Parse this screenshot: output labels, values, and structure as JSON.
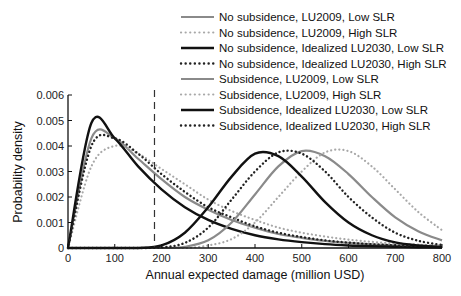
{
  "chart_data": {
    "type": "line",
    "title": "",
    "xlabel": "Annual expected damage (million USD)",
    "ylabel": "Probability density",
    "xlim": [
      0,
      800
    ],
    "ylim": [
      0,
      0.006
    ],
    "xticks": [
      0,
      100,
      200,
      300,
      400,
      500,
      600,
      700,
      800
    ],
    "xtick_labels": [
      "0",
      "100",
      "200",
      "300",
      "400",
      "500",
      "600",
      "700",
      "800"
    ],
    "yticks": [
      0,
      0.001,
      0.002,
      0.003,
      0.004,
      0.005,
      0.006
    ],
    "ytick_labels": [
      "0",
      "0.001",
      "0.002",
      "0.003",
      "0.004",
      "0.005",
      "0.006"
    ],
    "grid": false,
    "legend_position": "top-right",
    "annotations": [
      {
        "type": "vertical-dashed-line",
        "x": 185
      }
    ],
    "x": [
      0,
      50,
      100,
      150,
      200,
      250,
      300,
      350,
      400,
      450,
      500,
      550,
      600,
      650,
      700,
      750,
      800
    ],
    "series": [
      {
        "name": "No subsidence, LU2009, Low SLR",
        "style": "solid",
        "color": "#8a8a8a",
        "width": 2.2,
        "values": [
          0,
          0.0043,
          0.0043,
          0.0035,
          0.0027,
          0.002,
          0.0015,
          0.0011,
          0.0008,
          0.00055,
          0.0004,
          0.00028,
          0.0002,
          0.00014,
          0.0001,
          7e-05,
          5e-05
        ]
      },
      {
        "name": "No subsidence, LU2009, High SLR",
        "style": "dotted",
        "color": "#a8a8a8",
        "width": 2.2,
        "values": [
          0,
          0.0032,
          0.004,
          0.0037,
          0.0031,
          0.0025,
          0.0019,
          0.00145,
          0.0011,
          0.0008,
          0.0006,
          0.00045,
          0.00033,
          0.00024,
          0.00018,
          0.00013,
          0.0001
        ]
      },
      {
        "name": "No subsidence, Idealized LU2030, Low SLR",
        "style": "solid",
        "color": "#111111",
        "width": 2.4,
        "values": [
          0,
          0.0049,
          0.0043,
          0.0032,
          0.0023,
          0.0016,
          0.0011,
          0.00075,
          0.0005,
          0.00034,
          0.00023,
          0.00015,
          0.0001,
          7e-05,
          5e-05,
          3e-05,
          2e-05
        ]
      },
      {
        "name": "No subsidence, Idealized LU2030, High SLR",
        "style": "dotted",
        "color": "#222222",
        "width": 2.4,
        "values": [
          0,
          0.004,
          0.0043,
          0.0037,
          0.0029,
          0.0022,
          0.0016,
          0.0012,
          0.00085,
          0.0006,
          0.00043,
          0.0003,
          0.00021,
          0.00015,
          0.0001,
          7e-05,
          5e-05
        ]
      },
      {
        "name": "Subsidence, LU2009, Low SLR",
        "style": "solid",
        "color": "#8a8a8a",
        "width": 2.2,
        "values": [
          0,
          0,
          0,
          0,
          0,
          5e-05,
          0.0003,
          0.001,
          0.0021,
          0.0032,
          0.0038,
          0.0036,
          0.0029,
          0.002,
          0.0012,
          0.00065,
          0.0003
        ]
      },
      {
        "name": "Subsidence, LU2009, High SLR",
        "style": "dotted",
        "color": "#a8a8a8",
        "width": 2.2,
        "values": [
          0,
          0,
          0,
          0,
          0,
          0,
          0.0001,
          0.00035,
          0.001,
          0.002,
          0.003,
          0.00375,
          0.0038,
          0.0032,
          0.0023,
          0.0014,
          0.0007
        ]
      },
      {
        "name": "Subsidence, Idealized LU2030, Low SLR",
        "style": "solid",
        "color": "#111111",
        "width": 2.4,
        "values": [
          0,
          0,
          0,
          0,
          0.0001,
          0.0006,
          0.0016,
          0.0028,
          0.0037,
          0.0036,
          0.0028,
          0.0018,
          0.001,
          0.0005,
          0.00022,
          0.0001,
          4e-05
        ]
      },
      {
        "name": "Subsidence, Idealized LU2030, High SLR",
        "style": "dotted",
        "color": "#222222",
        "width": 2.4,
        "values": [
          0,
          0,
          0,
          0,
          2e-05,
          0.0002,
          0.0008,
          0.0019,
          0.003,
          0.00375,
          0.0037,
          0.003,
          0.002,
          0.0012,
          0.0006,
          0.00028,
          0.00012
        ]
      }
    ]
  }
}
